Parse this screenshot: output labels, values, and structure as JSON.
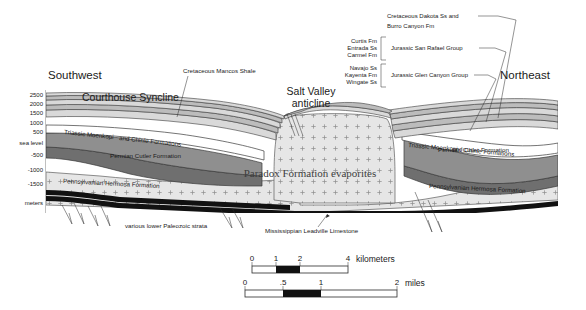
{
  "directions": {
    "left": "Southwest",
    "right": "Northeast"
  },
  "features": {
    "syncline": "Courthouse Syncline",
    "anticline_line1": "Salt Valley",
    "anticline_line2": "anticline"
  },
  "axis": {
    "unit_label": "meters",
    "ticks": [
      "2500",
      "2000",
      "1500",
      "1000",
      "500",
      "sea level",
      "-500",
      "-1000",
      "-1500"
    ]
  },
  "legend": {
    "cretaceous_line1": "Cretaceous Dakota Ss and",
    "cretaceous_line2": "Burro Canyon Fm",
    "san_rafael": {
      "group": "Jurassic San Rafael Group",
      "members": [
        "Curtis Fm",
        "Entrada Ss",
        "Carmel Fm"
      ]
    },
    "glen_canyon": {
      "group": "Jurassic Glen Canyon Group",
      "members": [
        "Navajo Ss",
        "Kayenta Fm",
        "Wingate Ss"
      ]
    }
  },
  "annotations": {
    "mancos": "Cretaceous Mancos Shale",
    "paleozoic": "various lower Paleozoic strata",
    "leadville": "Mississippian Leadville Limestone"
  },
  "units": {
    "moenkopi_left_a": "Triassic Moenkopi",
    "moenkopi_left_b": "and Chinle Formations",
    "moenkopi_right_a": "Triassic Moenkopi",
    "moenkopi_right_b": "and Chinle Formations",
    "cutler_left": "Permian Cutler Formation",
    "cutler_right": "Permian Cutler Formation",
    "hermosa_left": "Pennsylvanian Hermosa Formation",
    "hermosa_right": "Pennsylvanian Hermosa Formation",
    "paradox": "Paradox Formation evaporites"
  },
  "scale": {
    "km": {
      "label": "kilometers",
      "ticks": [
        "0",
        "1",
        "2",
        "4"
      ]
    },
    "mi": {
      "label": "miles",
      "ticks": [
        "0",
        ".5",
        "1",
        "2"
      ]
    }
  },
  "colors": {
    "background": "#ffffff",
    "ink": "#2b2b2b",
    "band_light": "#d9d9d9",
    "band_mid": "#bcbcbc",
    "cutler": "#8f8f8f",
    "hermosa": "#6f6f6f",
    "paradox": "#e3e3e3",
    "leadville": "#111111"
  }
}
